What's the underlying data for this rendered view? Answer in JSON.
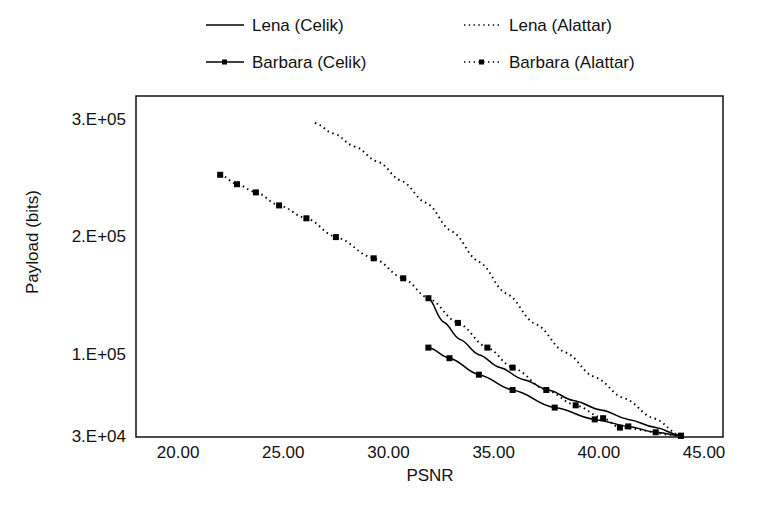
{
  "chart_data": {
    "type": "line",
    "title": "",
    "xlabel": "PSNR",
    "ylabel": "Payload (bits)",
    "xlim": [
      18.0,
      45.9
    ],
    "ylim": [
      30000,
      320000
    ],
    "grid": false,
    "legend_position": "top",
    "xticks": [
      "20.00",
      "25.00",
      "30.00",
      "35.00",
      "40.00",
      "45.00"
    ],
    "xtick_values": [
      20,
      25,
      30,
      35,
      40,
      45
    ],
    "yticks": [
      "3.E+04",
      "1.E+05",
      "2.E+05",
      "3.E+05"
    ],
    "ytick_values": [
      30000,
      100000,
      200000,
      300000
    ],
    "series": [
      {
        "name": "Lena (Celik)",
        "style": "solid",
        "marker": "none",
        "color": "#000000",
        "x": [
          31.9,
          32.6,
          33.4,
          34.3,
          35.3,
          36.4,
          37.6,
          38.8,
          40.1,
          41.4,
          42.7,
          43.9
        ],
        "y": [
          148000,
          128000,
          113000,
          100000,
          89000,
          79000,
          70000,
          61000,
          53000,
          45000,
          38000,
          31000
        ]
      },
      {
        "name": "Lena (Alattar)",
        "style": "dotted",
        "marker": "none",
        "color": "#000000",
        "x": [
          26.5,
          27.4,
          28.4,
          29.5,
          30.6,
          31.8,
          33.0,
          34.3,
          35.6,
          37.0,
          38.4,
          39.8,
          41.2,
          42.6,
          43.9
        ],
        "y": [
          297000,
          288000,
          277000,
          264000,
          248000,
          229000,
          205000,
          179000,
          152000,
          126000,
          102000,
          81000,
          63000,
          46000,
          31000
        ]
      },
      {
        "name": "Barbara (Celik)",
        "style": "solid",
        "marker": "square",
        "color": "#000000",
        "x": [
          31.9,
          32.9,
          34.3,
          35.9,
          37.9,
          39.8,
          41.4,
          42.7,
          43.9
        ],
        "y": [
          106000,
          97000,
          83000,
          70000,
          55000,
          45000,
          39000,
          34000,
          31000
        ]
      },
      {
        "name": "Barbara (Alattar)",
        "style": "dotted",
        "marker": "square",
        "color": "#000000",
        "x": [
          22.0,
          22.8,
          23.7,
          24.8,
          26.1,
          27.5,
          29.3,
          30.7,
          31.9,
          33.3,
          34.7,
          35.9,
          37.5,
          38.9,
          40.2,
          41.0,
          43.9
        ],
        "y": [
          253000,
          245000,
          238000,
          227000,
          216000,
          200000,
          182000,
          165000,
          148000,
          127000,
          106000,
          89000,
          70000,
          57000,
          46000,
          38000,
          31000
        ]
      }
    ]
  },
  "legend": {
    "items": [
      {
        "label": "Lena (Celik)",
        "style": "solid",
        "marker": "none"
      },
      {
        "label": "Lena (Alattar)",
        "style": "dotted",
        "marker": "none"
      },
      {
        "label": "Barbara (Celik)",
        "style": "solid",
        "marker": "square"
      },
      {
        "label": "Barbara (Alattar)",
        "style": "dotted",
        "marker": "square"
      }
    ]
  },
  "axes": {
    "x_title": "PSNR",
    "y_title": "Payload (bits)",
    "x_tick_labels": [
      "20.00",
      "25.00",
      "30.00",
      "35.00",
      "40.00",
      "45.00"
    ],
    "y_tick_labels": [
      "3.E+05",
      "2.E+05",
      "1.E+05",
      "3.E+04"
    ],
    "frame_color": "#000000"
  }
}
